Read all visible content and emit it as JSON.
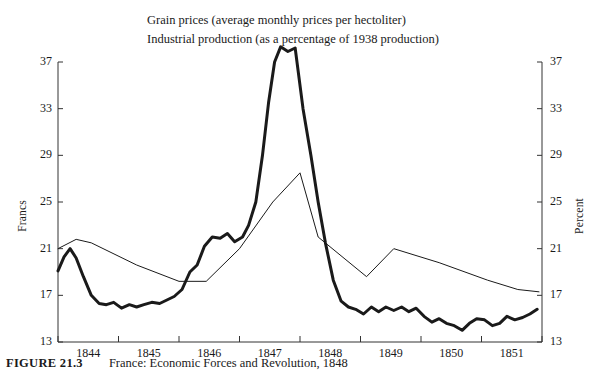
{
  "figure": {
    "number": "FIGURE 21.3",
    "caption": "France: Economic Forces and Revolution, 1848"
  },
  "legend": [
    {
      "key": "grain",
      "style": "thick",
      "label": "Grain prices (average monthly prices per hectoliter)"
    },
    {
      "key": "industrial",
      "style": "thin",
      "label": "Industrial production (as a percentage of 1938 production)"
    }
  ],
  "chart_data": {
    "type": "line",
    "title": "",
    "xlabel": "",
    "ylabel": "Francs",
    "y2label": "Percent",
    "grid": false,
    "legend_position": "top-left",
    "xlim": [
      1844,
      1852
    ],
    "ylim": [
      13,
      37
    ],
    "y2lim": [
      13,
      37
    ],
    "xticks": [
      1844,
      1845,
      1846,
      1847,
      1848,
      1849,
      1850,
      1851,
      1852
    ],
    "xticklabels": [
      "1844",
      "1845",
      "1846",
      "1847",
      "1848",
      "1849",
      "1850",
      "1851"
    ],
    "yticks": [
      13,
      17,
      21,
      25,
      29,
      33,
      37
    ],
    "yticklabels": [
      "13",
      "17",
      "21",
      "25",
      "29",
      "33",
      "37"
    ],
    "y2ticks": [
      13,
      17,
      21,
      25,
      29,
      33,
      37
    ],
    "y2ticklabels": [
      "13",
      "17",
      "21",
      "25",
      "29",
      "33",
      "37"
    ],
    "series": [
      {
        "name": "Grain prices (average monthly prices per hectoliter)",
        "axis": "left",
        "unit": "Francs",
        "width": 3,
        "color": "#1a1a1a",
        "x": [
          1844.0,
          1844.1,
          1844.2,
          1844.3,
          1844.42,
          1844.55,
          1844.68,
          1844.8,
          1844.92,
          1845.05,
          1845.18,
          1845.3,
          1845.42,
          1845.55,
          1845.68,
          1845.8,
          1845.92,
          1846.05,
          1846.18,
          1846.3,
          1846.42,
          1846.55,
          1846.68,
          1846.8,
          1846.92,
          1847.05,
          1847.15,
          1847.27,
          1847.38,
          1847.48,
          1847.58,
          1847.68,
          1847.8,
          1847.92,
          1848.05,
          1848.18,
          1848.3,
          1848.42,
          1848.55,
          1848.68,
          1848.8,
          1848.92,
          1849.05,
          1849.18,
          1849.3,
          1849.42,
          1849.55,
          1849.68,
          1849.8,
          1849.92,
          1850.05,
          1850.18,
          1850.3,
          1850.42,
          1850.55,
          1850.68,
          1850.8,
          1850.92,
          1851.05,
          1851.18,
          1851.3,
          1851.42,
          1851.55,
          1851.68,
          1851.8,
          1851.92
        ],
        "y": [
          19.1,
          20.3,
          21.0,
          20.2,
          18.6,
          17.0,
          16.3,
          16.2,
          16.4,
          15.9,
          16.2,
          16.0,
          16.2,
          16.4,
          16.3,
          16.6,
          16.9,
          17.5,
          19.0,
          19.6,
          21.2,
          22.0,
          21.9,
          22.3,
          21.6,
          22.0,
          23.0,
          25.0,
          29.0,
          33.5,
          37.0,
          38.3,
          37.9,
          38.2,
          33.0,
          29.0,
          25.0,
          21.5,
          18.3,
          16.5,
          16.0,
          15.8,
          15.4,
          16.0,
          15.6,
          16.0,
          15.7,
          16.0,
          15.6,
          15.9,
          15.2,
          14.7,
          15.0,
          14.6,
          14.4,
          14.0,
          14.6,
          15.0,
          14.9,
          14.4,
          14.6,
          15.2,
          14.9,
          15.1,
          15.4,
          15.8
        ]
      },
      {
        "name": "Industrial production (as a percentage of 1938 production)",
        "axis": "right",
        "unit": "Percent",
        "width": 1,
        "color": "#1a1a1a",
        "x": [
          1844.0,
          1844.3,
          1844.55,
          1845.3,
          1846.0,
          1846.45,
          1847.0,
          1847.55,
          1848.0,
          1848.3,
          1849.1,
          1849.55,
          1850.3,
          1851.1,
          1851.6,
          1851.95
        ],
        "y": [
          21.0,
          21.8,
          21.5,
          19.6,
          18.2,
          18.2,
          21.0,
          25.0,
          27.5,
          22.0,
          18.6,
          21.0,
          19.8,
          18.3,
          17.5,
          17.3
        ]
      }
    ],
    "annotations": []
  }
}
